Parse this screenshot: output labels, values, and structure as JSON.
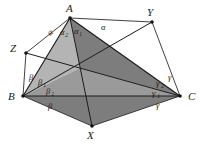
{
  "figure": {
    "kind": "geometry-diagram",
    "background_color": "#ffffff",
    "ink_color": "#1c1c1c",
    "shade_light_color": "#b4b4b4",
    "shade_mid_color": "#9a9a9a",
    "shade_dark_color": "#7d7d7d",
    "vertices": [
      {
        "id": "A",
        "label": "A",
        "x": 70,
        "y": 18,
        "label_x": 66,
        "label_y": 12,
        "dot": true
      },
      {
        "id": "B",
        "label": "B",
        "x": 23,
        "y": 96,
        "label_x": 8,
        "label_y": 100,
        "dot": true
      },
      {
        "id": "C",
        "label": "C",
        "x": 180,
        "y": 96,
        "label_x": 188,
        "label_y": 100,
        "dot": true
      },
      {
        "id": "X",
        "label": "X",
        "x": 92,
        "y": 126,
        "label_x": 87,
        "label_y": 139,
        "dot": true
      },
      {
        "id": "Y",
        "label": "Y",
        "x": 152,
        "y": 22,
        "label_x": 147,
        "label_y": 16,
        "dot": true
      },
      {
        "id": "Z",
        "label": "Z",
        "x": 26,
        "y": 53,
        "label_x": 10,
        "label_y": 52,
        "dot": true
      }
    ],
    "interior_point": {
      "id": "P",
      "x": 80,
      "y": 68
    },
    "outer_edges": [
      {
        "name": "edge-Z-A",
        "from": "Z",
        "to": "A"
      },
      {
        "name": "edge-A-Y",
        "from": "A",
        "to": "Y"
      },
      {
        "name": "edge-Y-C",
        "from": "Y",
        "to": "C"
      },
      {
        "name": "edge-C-X",
        "from": "C",
        "to": "X"
      },
      {
        "name": "edge-X-B",
        "from": "X",
        "to": "B"
      },
      {
        "name": "edge-B-Z",
        "from": "B",
        "to": "Z"
      }
    ],
    "triangle_edges": [
      {
        "name": "edge-A-B",
        "from": "A",
        "to": "B"
      },
      {
        "name": "edge-B-C",
        "from": "B",
        "to": "C"
      },
      {
        "name": "edge-C-A",
        "from": "C",
        "to": "A"
      }
    ],
    "cevians": [
      {
        "name": "cevian-A-X",
        "from": "A",
        "to": "X"
      },
      {
        "name": "cevian-B-Y",
        "from": "B",
        "to": "Y"
      },
      {
        "name": "cevian-C-Z",
        "from": "C",
        "to": "Z"
      }
    ],
    "shaded_regions": [
      {
        "name": "region-A-B-P",
        "tone": "light",
        "points": "70,18 23,96 80,68"
      },
      {
        "name": "region-A-P-C",
        "tone": "dark",
        "points": "70,18 80,68 180,96"
      },
      {
        "name": "region-B-X-C",
        "tone": "dark",
        "points": "23,96 92,126 180,96"
      },
      {
        "name": "region-P-B-C",
        "tone": "mid",
        "points": "80,68 23,96 180,96"
      }
    ],
    "angle_labels": [
      {
        "name": "angle-alpha-outer-left",
        "base": "α",
        "sub": "",
        "x": 50,
        "y": 36,
        "rotate": -38
      },
      {
        "name": "angle-alpha-2",
        "base": "α",
        "sub": "2",
        "x": 60,
        "y": 35,
        "rotate": 0
      },
      {
        "name": "angle-alpha-1",
        "base": "α",
        "sub": "1",
        "x": 74,
        "y": 34,
        "rotate": 0
      },
      {
        "name": "angle-alpha-outer-right",
        "base": "α",
        "sub": "",
        "x": 101,
        "y": 30,
        "rotate": 0
      },
      {
        "name": "angle-beta-outer",
        "base": "β",
        "sub": "",
        "x": 29,
        "y": 80,
        "rotate": 0
      },
      {
        "name": "angle-beta-1",
        "base": "β",
        "sub": "1",
        "x": 38,
        "y": 85,
        "rotate": 0
      },
      {
        "name": "angle-beta-2",
        "base": "β",
        "sub": "2",
        "x": 46,
        "y": 94,
        "rotate": 0
      },
      {
        "name": "angle-beta-bottom",
        "base": "β",
        "sub": "",
        "x": 48,
        "y": 109,
        "rotate": 0
      },
      {
        "name": "angle-gamma-outer",
        "base": "γ",
        "sub": "",
        "x": 168,
        "y": 80,
        "rotate": 0
      },
      {
        "name": "angle-gamma-2",
        "base": "γ",
        "sub": "2",
        "x": 156,
        "y": 86,
        "rotate": 0
      },
      {
        "name": "angle-gamma-1",
        "base": "γ",
        "sub": "1",
        "x": 152,
        "y": 96,
        "rotate": 0
      },
      {
        "name": "angle-gamma-bottom",
        "base": "γ",
        "sub": "",
        "x": 156,
        "y": 108,
        "rotate": 0
      }
    ]
  }
}
